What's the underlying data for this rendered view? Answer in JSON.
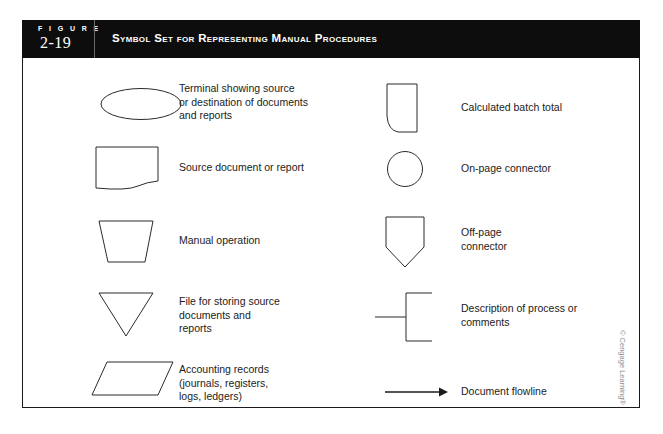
{
  "header": {
    "figure_word": "F I G U R E",
    "figure_number": "2-19",
    "title": "Symbol Set for Representing Manual Procedures"
  },
  "left_column": [
    {
      "symbol": "ellipse-terminal",
      "label": "Terminal showing source\nor destination of documents\nand reports"
    },
    {
      "symbol": "document",
      "label": "Source document or report"
    },
    {
      "symbol": "trapezoid-manual-operation",
      "label": "Manual operation"
    },
    {
      "symbol": "triangle-file",
      "label": "File for storing source\ndocuments and\nreports"
    },
    {
      "symbol": "parallelogram-accounting-records",
      "label": "Accounting records\n(journals, registers,\nlogs, ledgers)"
    }
  ],
  "right_column": [
    {
      "symbol": "calculated-batch-total",
      "label": "Calculated batch total"
    },
    {
      "symbol": "circle-on-page-connector",
      "label": "On-page connector"
    },
    {
      "symbol": "pentagon-off-page-connector",
      "label": "Off-page\nconnector"
    },
    {
      "symbol": "bracket-annotation",
      "label": "Description of process or\ncomments"
    },
    {
      "symbol": "arrow-flowline",
      "label": "Document flowline"
    }
  ],
  "footer": {
    "copyright": "© Cengage Learning®"
  },
  "colors": {
    "header_bg": "#0d0d0d",
    "header_text": "#ffffff",
    "border": "#1a1a1a",
    "symbol_stroke": "#2b2b2b",
    "body_text": "#1b1b1b",
    "copyright_text": "#8d8d8d"
  }
}
